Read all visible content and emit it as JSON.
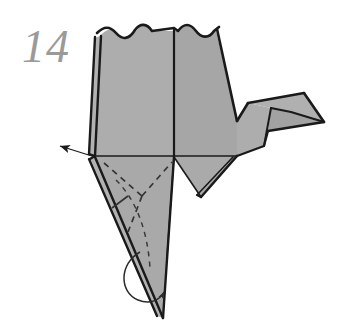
{
  "figure": {
    "step_number": "14",
    "step_number_color": "#9a9a9a",
    "background_color": "#ffffff",
    "paper_fill_color": "#a8a8a8",
    "paper_fill_shade_light": "#b4b4b4",
    "paper_fill_shade_dark": "#9d9d9d",
    "outline_color": "#1a1a1a",
    "fold_line_color": "#2b2b2b",
    "dashed_line_color": "#3a3a3a",
    "arrow_color": "#1a1a1a"
  },
  "annotations": {
    "pull_arrow_label": "pull-arrow",
    "rotation_arc_label": "rotation-arc",
    "valley_fold_label": "dashed-valley-fold",
    "crease_label": "existing-crease"
  },
  "geometry": {
    "body_left_wing": "95,156 100,36 145,27 174,156",
    "body_right_wing": "174,156 206,30 237,120 237,156",
    "body_lower_left": "95,156 174,156 162,318",
    "body_lower_right": "174,156 237,156 200,196",
    "neck": "237,120 237,156 262,145 272,106 248,102",
    "head": "248,102 272,106 305,94 325,122 290,112 268,131",
    "left_layer_edge": "95,156 100,36",
    "center_vertical": "174,27 174,318",
    "horizontal_crease": "95,156 237,156"
  }
}
